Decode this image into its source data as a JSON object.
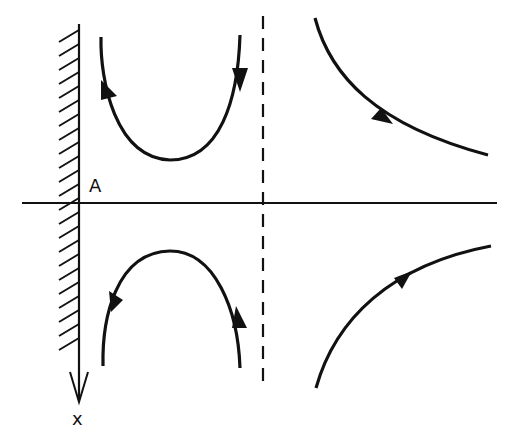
{
  "diagram": {
    "type": "phase-portrait",
    "labels": {
      "point_a": "A",
      "axis_x": "x"
    },
    "colors": {
      "ink": "#111111",
      "background": "#ffffff"
    },
    "elements": {
      "wall": {
        "x": 79,
        "y_top": 24,
        "y_bottom": 350,
        "hatched_side": "left"
      },
      "horizontal_axis": {
        "y": 203,
        "x_start": 22,
        "x_end": 497
      },
      "x_axis_arrow": {
        "x": 79,
        "direction": "down",
        "tip_y": 402
      },
      "dashed_line": {
        "x": 263,
        "y_top": 16,
        "y_bottom": 390
      },
      "trajectories": [
        {
          "name": "upper-left-u-curve",
          "shape": "U opening up",
          "arrows": [
            "down on right branch",
            "up on left branch"
          ]
        },
        {
          "name": "lower-left-arch",
          "shape": "arch opening down",
          "arrows": [
            "up on right branch",
            "down on left branch"
          ]
        },
        {
          "name": "upper-right-decay",
          "shape": "decreasing hyperbola-like",
          "arrows": [
            "down-right"
          ]
        },
        {
          "name": "lower-right-rise",
          "shape": "increasing curve",
          "arrows": [
            "up-right"
          ]
        }
      ]
    }
  }
}
